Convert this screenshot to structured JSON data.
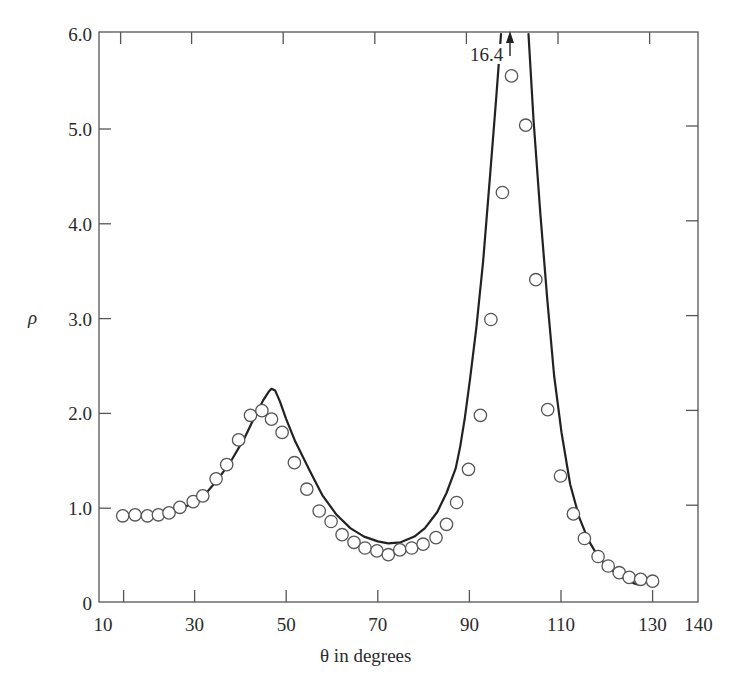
{
  "chart_data": {
    "type": "scatter",
    "title": "",
    "xlabel": "θ in degrees",
    "ylabel": "ρ",
    "xlim": [
      10,
      140
    ],
    "ylim": [
      0,
      6.0
    ],
    "grid": false,
    "legend": null,
    "x_ticks": [
      10,
      30,
      50,
      70,
      90,
      110,
      130,
      140
    ],
    "x_tick_labels": [
      "10",
      "30",
      "50",
      "70",
      "90",
      "110",
      "130",
      "140"
    ],
    "y_ticks": [
      0,
      1,
      2,
      3,
      4,
      5,
      6
    ],
    "y_tick_labels": [
      "0",
      "1.0",
      "2.0",
      "3.0",
      "4.0",
      "5.0",
      "6.0"
    ],
    "annotations": [
      {
        "text": "16.4",
        "x": 99,
        "y": 5.9,
        "note": "arrow pointing up: theoretical peak value off-scale"
      }
    ],
    "series": [
      {
        "name": "measured",
        "style": "open-circles",
        "x": [
          14.3,
          17.0,
          19.7,
          22.1,
          24.4,
          26.8,
          29.7,
          31.8,
          34.7,
          37.0,
          39.6,
          42.2,
          44.7,
          46.8,
          49.1,
          51.8,
          54.5,
          57.2,
          59.8,
          62.2,
          64.8,
          67.2,
          69.8,
          72.3,
          74.8,
          77.4,
          79.9,
          82.7,
          85.0,
          87.2,
          89.8,
          92.4,
          94.7,
          97.2,
          99.2,
          102.3,
          104.5,
          107.1,
          109.9,
          112.7,
          115.1,
          118.1,
          120.3,
          122.7,
          124.9,
          127.4,
          130.0
        ],
        "y": [
          0.92,
          0.93,
          0.92,
          0.93,
          0.95,
          1.01,
          1.07,
          1.13,
          1.31,
          1.46,
          1.72,
          1.98,
          2.03,
          1.94,
          1.8,
          1.48,
          1.2,
          0.97,
          0.86,
          0.72,
          0.64,
          0.58,
          0.55,
          0.51,
          0.56,
          0.58,
          0.62,
          0.69,
          0.83,
          1.06,
          1.41,
          1.98,
          2.99,
          4.33,
          5.56,
          5.04,
          3.41,
          2.04,
          1.34,
          0.94,
          0.68,
          0.49,
          0.39,
          0.32,
          0.27,
          0.25,
          0.23
        ]
      },
      {
        "name": "theory",
        "style": "solid-line",
        "x": [
          14.5,
          20,
          25,
          29,
          32,
          35,
          38,
          41,
          43,
          45,
          46.2,
          46.8,
          47.6,
          48.6,
          50,
          52,
          55.2,
          58,
          61,
          64,
          67,
          70,
          72.3,
          75,
          78,
          80.3,
          83,
          85,
          87,
          88,
          89,
          90.1,
          91.5,
          93,
          94.5,
          95.8,
          96.9,
          98,
          99,
          100,
          101,
          102,
          102.9,
          104,
          105.5,
          107,
          108.5,
          110.1,
          112,
          114,
          116,
          118,
          120,
          122,
          124,
          125.8,
          127.2
        ],
        "y": [
          0.93,
          0.93,
          0.95,
          1.04,
          1.13,
          1.3,
          1.5,
          1.75,
          1.95,
          2.14,
          2.23,
          2.26,
          2.24,
          2.13,
          1.94,
          1.7,
          1.39,
          1.13,
          0.93,
          0.79,
          0.7,
          0.65,
          0.63,
          0.64,
          0.7,
          0.79,
          0.96,
          1.16,
          1.42,
          1.65,
          1.95,
          2.35,
          2.9,
          3.6,
          4.5,
          5.3,
          6.0,
          16.4,
          16.4,
          16.4,
          16.4,
          16.4,
          6.0,
          5.1,
          4.1,
          3.2,
          2.4,
          1.8,
          1.25,
          0.9,
          0.66,
          0.5,
          0.39,
          0.31,
          0.25,
          0.21,
          0.19
        ]
      }
    ]
  },
  "axes": {
    "xlabel": "θ in degrees",
    "ylabel": "ρ",
    "peak_label": "16.4"
  }
}
